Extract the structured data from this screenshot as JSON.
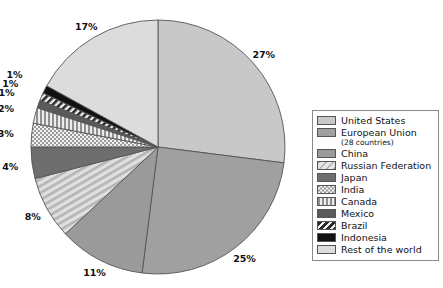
{
  "chart_data": {
    "type": "pie",
    "title": "",
    "xlabel": "",
    "ylabel": "",
    "legend_position": "right",
    "grid": false,
    "unit": "%",
    "categories": [
      "United States",
      "European Union (28 countries)",
      "China",
      "Russian Federation",
      "Japan",
      "India",
      "Canada",
      "Mexico",
      "Brazil",
      "Indonesia",
      "Rest of the world"
    ],
    "values": [
      27,
      25,
      11,
      8,
      4,
      3,
      2,
      1,
      1,
      1,
      17
    ],
    "labels": [
      "27%",
      "25%",
      "11%",
      "8%",
      "4%",
      "3%",
      "2%",
      "1%",
      "1%",
      "1%",
      "17%"
    ],
    "slices": [
      {
        "name": "United States",
        "value": 27,
        "label": "27%",
        "fill": "#c8c8c8",
        "pattern": "solid",
        "legend_label": "United States",
        "legend_sublabel": ""
      },
      {
        "name": "European Union",
        "value": 25,
        "label": "25%",
        "fill": "#a0a0a0",
        "pattern": "solid",
        "legend_label": "European Union",
        "legend_sublabel": "(28 countries)"
      },
      {
        "name": "China",
        "value": 11,
        "label": "11%",
        "fill": "#9a9a9a",
        "pattern": "solid",
        "legend_label": "China",
        "legend_sublabel": ""
      },
      {
        "name": "Russian Federation",
        "value": 8,
        "label": "8%",
        "fill": "#d4d4d4",
        "pattern": "diag-light",
        "legend_label": "Russian Federation",
        "legend_sublabel": ""
      },
      {
        "name": "Japan",
        "value": 4,
        "label": "4%",
        "fill": "#6e6e6e",
        "pattern": "solid",
        "legend_label": "Japan",
        "legend_sublabel": ""
      },
      {
        "name": "India",
        "value": 3,
        "label": "3%",
        "fill": "#e8e8e8",
        "pattern": "checker",
        "legend_label": "India",
        "legend_sublabel": ""
      },
      {
        "name": "Canada",
        "value": 2,
        "label": "2%",
        "fill": "#bdbdbd",
        "pattern": "vstripe",
        "legend_label": "Canada",
        "legend_sublabel": ""
      },
      {
        "name": "Mexico",
        "value": 1,
        "label": "1%",
        "fill": "#5a5a5a",
        "pattern": "solid",
        "legend_label": "Mexico",
        "legend_sublabel": ""
      },
      {
        "name": "Brazil",
        "value": 1,
        "label": "1%",
        "fill": "#3a3a3a",
        "pattern": "diag-dark",
        "legend_label": "Brazil",
        "legend_sublabel": ""
      },
      {
        "name": "Indonesia",
        "value": 1,
        "label": "1%",
        "fill": "#111111",
        "pattern": "solid",
        "legend_label": "Indonesia",
        "legend_sublabel": ""
      },
      {
        "name": "Rest of the world",
        "value": 17,
        "label": "17%",
        "fill": "#dcdcdc",
        "pattern": "solid",
        "legend_label": "Rest of the world",
        "legend_sublabel": ""
      }
    ]
  },
  "geometry": {
    "center_x": 158,
    "center_y": 147,
    "radius": 127,
    "start_angle_deg": -90,
    "direction": "clockwise"
  },
  "colors": {
    "background": "#ffffff",
    "outline": "#555555",
    "text": "#111111",
    "legend_border": "#8a8a8a"
  }
}
